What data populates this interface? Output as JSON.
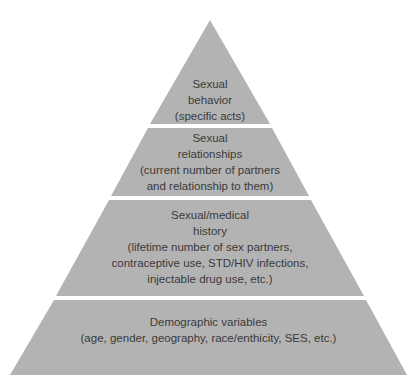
{
  "diagram": {
    "type": "pyramid",
    "fill_color": "#b3b3b3",
    "background_color": "#ffffff",
    "text_color": "#3a3a3a",
    "levels": [
      {
        "position": "top",
        "lines": [
          "Sexual",
          "behavior",
          "(specific acts)"
        ]
      },
      {
        "position": "upper-middle",
        "lines": [
          "Sexual",
          "relationships",
          "(current number of partners",
          "and relationship to them)"
        ]
      },
      {
        "position": "lower-middle",
        "lines": [
          "Sexual/medical",
          "history",
          "(lifetime number of sex partners,",
          "contraceptive use, STD/HIV infections,",
          "injectable drug use, etc.)"
        ]
      },
      {
        "position": "base",
        "lines": [
          "Demographic variables",
          "(age, gender, geography, race/enthicity, SES, etc.)"
        ]
      }
    ]
  }
}
